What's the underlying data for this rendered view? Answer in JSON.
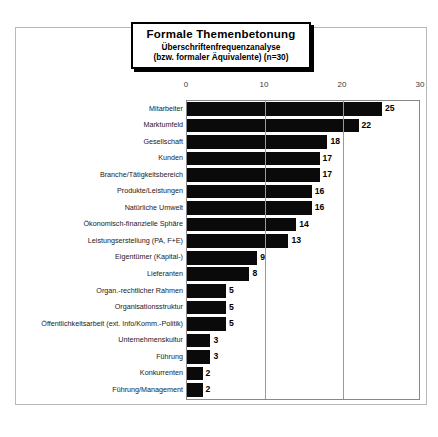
{
  "title": {
    "main": "Formale Themenbetonung",
    "sub1": "Überschriftenfrequenzanalyse",
    "sub2": "(bzw. formaler Äquivalente) (n=30)"
  },
  "chart_data": {
    "type": "bar",
    "orientation": "horizontal",
    "title": "Formale Themenbetonung",
    "subtitle": "Überschriftenfrequenzanalyse (bzw. formaler Äquivalente) (n=30)",
    "xlabel": "",
    "ylabel": "",
    "xlim": [
      0,
      30
    ],
    "xticks": [
      0,
      10,
      20,
      30
    ],
    "xtick_labels": [
      "0",
      "10",
      "20",
      "30"
    ],
    "gridlines": [
      10,
      20
    ],
    "grid": true,
    "legend": null,
    "bar_color": "#0a0a0a",
    "categories": [
      "Mitarbeiter",
      "Marktumfeld",
      "Gesellschaft",
      "Kunden",
      "Branche/Tätigkeitsbereich",
      "Produkte/Leistungen",
      "Natürliche Umwelt",
      "Ökonomisch-finanzielle Sphäre",
      "Leistungserstellung (PA, F+E)",
      "Eigentümer (Kapital-)",
      "Lieferanten",
      "Organ.-rechtlicher Rahmen",
      "Organisationsstruktur",
      "Öffentlichkeitsarbeit (ext. Info/Komm.-Politik)",
      "Unternehmenskultur",
      "Führung",
      "Konkurrenten",
      "Führung/Management"
    ],
    "values": [
      25,
      22,
      18,
      17,
      17,
      16,
      16,
      14,
      13,
      9,
      8,
      5,
      5,
      5,
      3,
      3,
      2,
      2
    ]
  }
}
